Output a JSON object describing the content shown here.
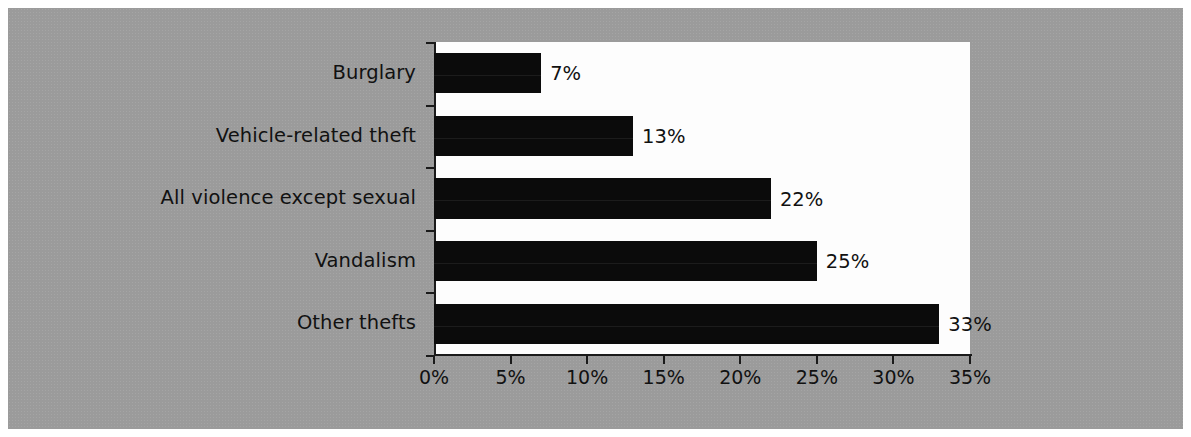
{
  "figure": {
    "background_color": "#ffffff",
    "panel_color": "#9b9b9b",
    "plot_background": "#fdfdfd",
    "bar_color": "#0b0b0b",
    "axis_color": "#1a1a1a",
    "text_color": "#111111"
  },
  "chart_data": {
    "type": "bar",
    "orientation": "horizontal",
    "title": "",
    "subtitle": "",
    "xlabel": "",
    "ylabel": "",
    "categories": [
      "Burglary",
      "Vehicle-related theft",
      "All violence except sexual",
      "Vandalism",
      "Other thefts"
    ],
    "values": [
      7,
      13,
      22,
      25,
      33
    ],
    "value_labels": [
      "7%",
      "13%",
      "22%",
      "25%",
      "33%"
    ],
    "xlim": [
      0,
      35
    ],
    "xticks": [
      0,
      5,
      10,
      15,
      20,
      25,
      30,
      35
    ],
    "xtick_labels": [
      "0%",
      "5%",
      "10%",
      "15%",
      "20%",
      "25%",
      "30%",
      "35%"
    ],
    "grid": false,
    "legend": null,
    "legend_position": "none",
    "units": "percent"
  }
}
